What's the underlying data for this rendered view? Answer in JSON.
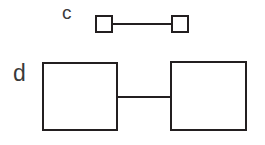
{
  "diagram": {
    "background_color": "#ffffff",
    "stroke_color": "#231f20",
    "label_color": "#3a3a3a",
    "width": 265,
    "height": 145,
    "rows": [
      {
        "id": "c",
        "label": "c",
        "node_size": "small",
        "nodes": [
          {
            "name": "square",
            "x": 95,
            "y": 15,
            "w": 18,
            "h": 18
          },
          {
            "name": "square",
            "x": 171,
            "y": 15,
            "w": 18,
            "h": 18
          }
        ],
        "edge": {
          "x": 112,
          "y": 23,
          "length": 60,
          "thickness": 2
        }
      },
      {
        "id": "d",
        "label": "d",
        "node_size": "large",
        "nodes": [
          {
            "name": "square",
            "x": 42,
            "y": 62,
            "w": 76,
            "h": 69
          },
          {
            "name": "square",
            "x": 170,
            "y": 61,
            "w": 77,
            "h": 70
          }
        ],
        "edge": {
          "x": 117,
          "y": 96,
          "length": 54,
          "thickness": 2
        }
      }
    ]
  }
}
